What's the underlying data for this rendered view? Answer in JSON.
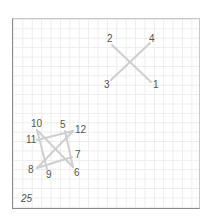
{
  "puzzle": {
    "type": "connect-the-dots / untangle",
    "level_number": "25",
    "line_color": "#cfcfcf",
    "label_color": "#555555",
    "points": [
      {
        "id": "1",
        "label": "1",
        "x": 151,
        "y": 82,
        "lx": 153,
        "ly": 80
      },
      {
        "id": "2",
        "label": "2",
        "x": 112,
        "y": 45,
        "lx": 107,
        "ly": 34
      },
      {
        "id": "3",
        "label": "3",
        "x": 111,
        "y": 80,
        "lx": 104,
        "ly": 80
      },
      {
        "id": "4",
        "label": "4",
        "x": 150,
        "y": 43,
        "lx": 149,
        "ly": 34
      },
      {
        "id": "5",
        "label": "5",
        "x": 65,
        "y": 131,
        "lx": 60,
        "ly": 120
      },
      {
        "id": "6",
        "label": "6",
        "x": 73,
        "y": 167,
        "lx": 74,
        "ly": 168
      },
      {
        "id": "7",
        "label": "7",
        "x": 72,
        "y": 157,
        "lx": 75,
        "ly": 150
      },
      {
        "id": "8",
        "label": "8",
        "x": 37,
        "y": 168,
        "lx": 28,
        "ly": 165
      },
      {
        "id": "9",
        "label": "9",
        "x": 47,
        "y": 169,
        "lx": 46,
        "ly": 170
      },
      {
        "id": "10",
        "label": "10",
        "x": 37,
        "y": 130,
        "lx": 31,
        "ly": 119
      },
      {
        "id": "11",
        "label": "11",
        "x": 37,
        "y": 140,
        "lx": 26,
        "ly": 135
      },
      {
        "id": "12",
        "label": "12",
        "x": 73,
        "y": 131,
        "lx": 75,
        "ly": 125
      }
    ],
    "edges": [
      [
        "2",
        "1"
      ],
      [
        "3",
        "4"
      ],
      [
        "5",
        "6"
      ],
      [
        "7",
        "8"
      ],
      [
        "9",
        "10"
      ],
      [
        "11",
        "12"
      ],
      [
        "10",
        "6"
      ],
      [
        "12",
        "8"
      ]
    ]
  }
}
